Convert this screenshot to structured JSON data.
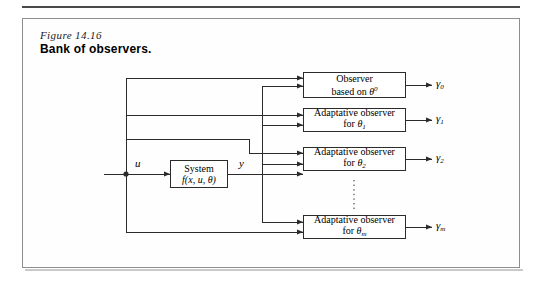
{
  "caption": {
    "figure_number": "Figure 14.16",
    "title": "Bank of observers."
  },
  "diagram": {
    "system_block": {
      "line1": "System",
      "line2_prefix": "f(x, u, ",
      "line2_theta": "θ",
      "line2_suffix": ")"
    },
    "signals": {
      "input_u": "u",
      "output_y": "y"
    },
    "observers": [
      {
        "name": "observer-0",
        "line1": "Observer",
        "line2_prefix": "based on ",
        "line2_theta": "θ",
        "line2_sup": "0",
        "line2_sub": "",
        "output_base": "γ",
        "output_sub": "0"
      },
      {
        "name": "observer-1",
        "line1": "Adaptative observer",
        "line2_prefix": "for ",
        "line2_theta": "θ",
        "line2_sup": "",
        "line2_sub": "1",
        "output_base": "γ",
        "output_sub": "1"
      },
      {
        "name": "observer-2",
        "line1": "Adaptative observer",
        "line2_prefix": "for ",
        "line2_theta": "θ",
        "line2_sup": "",
        "line2_sub": "2",
        "output_base": "γ",
        "output_sub": "2"
      },
      {
        "name": "observer-m",
        "line1": "Adaptative observer",
        "line2_prefix": "for ",
        "line2_theta": "θ",
        "line2_sup": "",
        "line2_sub": "m",
        "output_base": "γ",
        "output_sub": "m"
      }
    ],
    "ellipsis_note": "vertical-dotted-continuation",
    "colors": {
      "line": "#2b2b2b",
      "frame": "#8e8e8e",
      "rule": "#4a4a4a"
    }
  }
}
